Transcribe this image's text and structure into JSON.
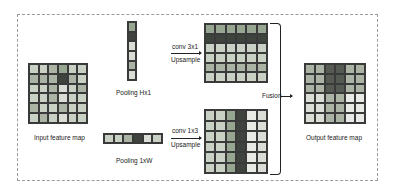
{
  "diagram": {
    "title": "",
    "labels": {
      "input": "Input feature map",
      "pool_h": "Pooling Hx1",
      "pool_w": "Pooling 1xW",
      "conv_top": "conv 3x1",
      "up_top": "Upsample",
      "conv_bottom": "conv 1x3",
      "up_bottom": "Upsample",
      "fusion": "Fusion",
      "output": "Output feature map"
    },
    "colors": {
      "light": "#d9ddd5",
      "light2": "#c9d0c4",
      "mid": "#aab3a4",
      "midgreen": "#97a690",
      "dark": "#555a52",
      "darker": "#3f433d",
      "vlight": "#e8ebe5"
    },
    "input_grid": [
      [
        "light2",
        "light2",
        "mid",
        "midgreen",
        "light2",
        "light2"
      ],
      [
        "mid",
        "mid",
        "mid",
        "darker",
        "mid",
        "light2"
      ],
      [
        "light2",
        "light2",
        "mid",
        "light",
        "light2",
        "mid"
      ],
      [
        "light2",
        "light2",
        "mid",
        "light",
        "light2",
        "light2"
      ],
      [
        "mid",
        "light2",
        "light2",
        "mid",
        "light2",
        "light2"
      ],
      [
        "light2",
        "mid",
        "light2",
        "light",
        "light2",
        "light2"
      ]
    ],
    "pool_h_strip": [
      "midgreen",
      "darker",
      "light",
      "light",
      "mid",
      "light"
    ],
    "pool_w_strip": [
      "light2",
      "light2",
      "mid",
      "darker",
      "light",
      "light2"
    ],
    "conv_top_grid_rows": [
      "midgreen",
      "darker",
      "light2",
      "light2",
      "mid",
      "light2"
    ],
    "conv_bottom_grid_cols": [
      "light2",
      "light2",
      "midgreen",
      "darker",
      "vlight",
      "light"
    ],
    "output_grid": [
      [
        "mid",
        "mid",
        "dark",
        "dark",
        "mid",
        "mid"
      ],
      [
        "mid",
        "mid",
        "dark",
        "dark",
        "mid",
        "mid"
      ],
      [
        "mid",
        "mid",
        "dark",
        "dark",
        "mid",
        "mid"
      ],
      [
        "light",
        "light",
        "mid",
        "mid",
        "vlight",
        "vlight"
      ],
      [
        "light",
        "light",
        "mid",
        "mid",
        "vlight",
        "vlight"
      ],
      [
        "light",
        "light",
        "mid",
        "mid",
        "vlight",
        "vlight"
      ]
    ]
  }
}
